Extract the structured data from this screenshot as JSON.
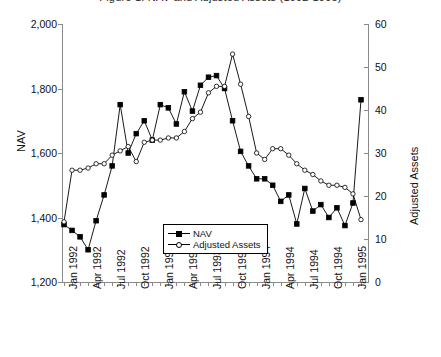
{
  "title_clipped": "Figure 1. NAV and Adjusted Assets (1992-1995)",
  "legend": {
    "nav_label": "NAV",
    "assets_label": "Adjusted Assets"
  },
  "chart_data": {
    "type": "line",
    "title": "Figure 1. NAV and Adjusted Assets (1992-1995)",
    "xlabel": "",
    "ylabel": "NAV",
    "y2label": "Adjusted Assets",
    "ylim": [
      1200,
      2000
    ],
    "y2lim": [
      0,
      60
    ],
    "ytick_labels": [
      "1,200",
      "1,400",
      "1,600",
      "1,800",
      "2,000"
    ],
    "yticks": [
      1200,
      1400,
      1600,
      1800,
      2000
    ],
    "y2tick_labels": [
      "0",
      "10",
      "20",
      "30",
      "40",
      "50",
      "60"
    ],
    "y2ticks": [
      0,
      10,
      20,
      30,
      40,
      50,
      60
    ],
    "grid": false,
    "legend_position": "inside lower-left",
    "xtick_labels": [
      "Jan 1992",
      "Apr 1992",
      "Jul 1992",
      "Oct 1992",
      "Jan 1993",
      "Apr 1993",
      "Jul 1993",
      "Oct 1993",
      "Jan 1994",
      "Apr 1994",
      "Jul 1994",
      "Oct 1994",
      "Jan 1995"
    ],
    "x": [
      "Jan 1992",
      "Feb 1992",
      "Mar 1992",
      "Apr 1992",
      "May 1992",
      "Jun 1992",
      "Jul 1992",
      "Aug 1992",
      "Sep 1992",
      "Oct 1992",
      "Nov 1992",
      "Dec 1992",
      "Jan 1993",
      "Feb 1993",
      "Mar 1993",
      "Apr 1993",
      "May 1993",
      "Jun 1993",
      "Jul 1993",
      "Aug 1993",
      "Sep 1993",
      "Oct 1993",
      "Nov 1993",
      "Dec 1993",
      "Jan 1994",
      "Feb 1994",
      "Mar 1994",
      "Apr 1994",
      "May 1994",
      "Jun 1994",
      "Jul 1994",
      "Aug 1994",
      "Sep 1994",
      "Oct 1994",
      "Nov 1994",
      "Dec 1994",
      "Jan 1995",
      "Feb 1995"
    ],
    "series": [
      {
        "name": "NAV",
        "axis": "left",
        "marker": "filled-square",
        "values": [
          1378,
          1360,
          1340,
          1300,
          1390,
          1470,
          1560,
          1750,
          1600,
          1660,
          1700,
          1640,
          1750,
          1740,
          1690,
          1790,
          1730,
          1810,
          1835,
          1840,
          1800,
          1700,
          1605,
          1560,
          1520,
          1520,
          1500,
          1450,
          1470,
          1380,
          1490,
          1420,
          1440,
          1400,
          1430,
          1375,
          1445,
          1765
        ]
      },
      {
        "name": "Adjusted Assets",
        "axis": "right",
        "marker": "open-circle",
        "values": [
          14.0,
          26.0,
          26.0,
          26.5,
          27.5,
          27.5,
          29.5,
          30.5,
          31.5,
          28.0,
          32.5,
          33.0,
          33.0,
          33.5,
          33.5,
          35.0,
          38.0,
          39.5,
          44.0,
          45.5,
          45.5,
          53.0,
          46.0,
          38.5,
          30.0,
          28.5,
          31.0,
          31.0,
          29.5,
          27.5,
          26.0,
          25.0,
          23.5,
          22.5,
          22.5,
          22.0,
          20.5,
          14.5
        ]
      }
    ]
  }
}
